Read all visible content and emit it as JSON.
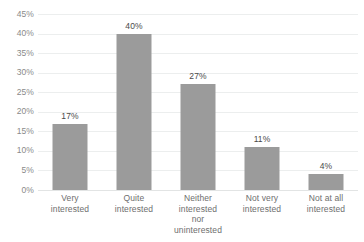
{
  "chart_data": {
    "type": "bar",
    "title": "",
    "subtitle": "",
    "xlabel": "",
    "ylabel": "",
    "categories": [
      "Very interested",
      "Quite interested",
      "Neither interested nor uninterested",
      "Not very interested",
      "Not at all interested"
    ],
    "category_lines": [
      [
        "Very",
        "interested"
      ],
      [
        "Quite",
        "interested"
      ],
      [
        "Neither",
        "interested",
        "nor",
        "uninterested"
      ],
      [
        "Not very",
        "interested"
      ],
      [
        "Not at all",
        "interested"
      ]
    ],
    "values": [
      17,
      40,
      27,
      11,
      4
    ],
    "value_labels": [
      "17%",
      "40%",
      "27%",
      "11%",
      "4%"
    ],
    "ylim": [
      0,
      45
    ],
    "ytick_values": [
      0,
      5,
      10,
      15,
      20,
      25,
      30,
      35,
      40,
      45
    ],
    "ytick_labels": [
      "0%",
      "5%",
      "10%",
      "15%",
      "20%",
      "25%",
      "30%",
      "35%",
      "40%",
      "45%"
    ],
    "grid": true,
    "legend": false,
    "legend_position": "none",
    "bar_color": "#9b9b9b",
    "gridline_color": "#eceeee",
    "axis_label_color": "#8a8a8a",
    "value_label_color": "#4a4a4a",
    "category_label_color": "#6e6e6e",
    "background_color": "#ffffff"
  }
}
